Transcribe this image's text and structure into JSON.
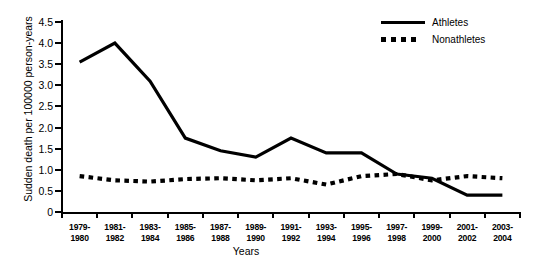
{
  "chart_data": {
    "type": "line",
    "title": "",
    "xlabel": "Years",
    "ylabel": "Sudden death per 100000 person-years",
    "categories": [
      "1979-\n1980",
      "1981-\n1982",
      "1983-\n1984",
      "1985-\n1986",
      "1987-\n1988",
      "1989-\n1990",
      "1991-\n1992",
      "1993-\n1994",
      "1995-\n1996",
      "1997-\n1998",
      "1999-\n2000",
      "2001-\n2002",
      "2003-\n2004"
    ],
    "category_labels": [
      {
        "line1": "1979-",
        "line2": "1980"
      },
      {
        "line1": "1981-",
        "line2": "1982"
      },
      {
        "line1": "1983-",
        "line2": "1984"
      },
      {
        "line1": "1985-",
        "line2": "1986"
      },
      {
        "line1": "1987-",
        "line2": "1988"
      },
      {
        "line1": "1989-",
        "line2": "1990"
      },
      {
        "line1": "1991-",
        "line2": "1992"
      },
      {
        "line1": "1993-",
        "line2": "1994"
      },
      {
        "line1": "1995-",
        "line2": "1996"
      },
      {
        "line1": "1997-",
        "line2": "1998"
      },
      {
        "line1": "1999-",
        "line2": "2000"
      },
      {
        "line1": "2001-",
        "line2": "2002"
      },
      {
        "line1": "2003-",
        "line2": "2004"
      }
    ],
    "ylim": [
      0,
      4.5
    ],
    "yticks": [
      0,
      0.5,
      1.0,
      1.5,
      2.0,
      2.5,
      3.0,
      3.5,
      4.0,
      4.5
    ],
    "ytick_labels": [
      "0",
      "0.5",
      "1.0",
      "1.5",
      "2.0",
      "2.5",
      "3.0",
      "3.5",
      "4.0",
      "4.5"
    ],
    "grid": false,
    "legend_position": "top-right",
    "series": [
      {
        "name": "Athletes",
        "style": "solid",
        "color": "#000000",
        "values": [
          3.55,
          4.0,
          3.1,
          1.75,
          1.45,
          1.3,
          1.75,
          1.4,
          1.4,
          0.9,
          0.8,
          0.4,
          0.4
        ]
      },
      {
        "name": "Nonathletes",
        "style": "dotted",
        "color": "#000000",
        "values": [
          0.85,
          0.75,
          0.72,
          0.78,
          0.8,
          0.75,
          0.8,
          0.65,
          0.85,
          0.9,
          0.75,
          0.85,
          0.8
        ]
      }
    ]
  },
  "legend": {
    "items": [
      {
        "label": "Athletes",
        "style": "solid"
      },
      {
        "label": "Nonathletes",
        "style": "dotted"
      }
    ]
  }
}
